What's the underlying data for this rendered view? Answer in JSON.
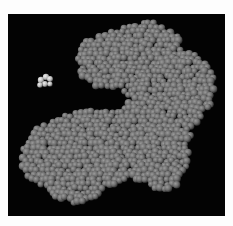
{
  "image": {
    "description": "Space-filling molecular model of a protein with a small bound ligand on black background",
    "background": "#030303",
    "border": "#fdfdfd",
    "sphere_color": "#6b6b6b",
    "sphere_highlight": "#9a9a9a",
    "sphere_shadow": "#2a2a2a",
    "ligand_color": "#d8d8d8",
    "protein_outline": [
      [
        80,
        44
      ],
      [
        100,
        36
      ],
      [
        135,
        24
      ],
      [
        150,
        20
      ],
      [
        160,
        24
      ],
      [
        175,
        34
      ],
      [
        183,
        42
      ],
      [
        180,
        52
      ],
      [
        200,
        56
      ],
      [
        212,
        66
      ],
      [
        214,
        86
      ],
      [
        212,
        104
      ],
      [
        200,
        118
      ],
      [
        192,
        130
      ],
      [
        190,
        150
      ],
      [
        186,
        170
      ],
      [
        175,
        188
      ],
      [
        160,
        190
      ],
      [
        145,
        184
      ],
      [
        130,
        180
      ],
      [
        110,
        186
      ],
      [
        95,
        200
      ],
      [
        78,
        206
      ],
      [
        58,
        200
      ],
      [
        50,
        190
      ],
      [
        30,
        180
      ],
      [
        20,
        166
      ],
      [
        24,
        146
      ],
      [
        35,
        130
      ],
      [
        56,
        118
      ],
      [
        80,
        110
      ],
      [
        100,
        112
      ],
      [
        118,
        112
      ],
      [
        126,
        104
      ],
      [
        112,
        96
      ],
      [
        94,
        88
      ],
      [
        80,
        76
      ],
      [
        78,
        60
      ]
    ],
    "gap_cutout": [
      [
        92,
        88
      ],
      [
        120,
        88
      ],
      [
        130,
        100
      ],
      [
        118,
        110
      ],
      [
        98,
        108
      ],
      [
        86,
        100
      ]
    ],
    "ligand_spheres": [
      [
        41,
        80,
        3.2
      ],
      [
        46,
        77,
        3.2
      ],
      [
        50,
        79,
        3
      ],
      [
        45,
        84,
        3
      ],
      [
        40,
        85,
        2.8
      ],
      [
        50,
        84,
        2.6
      ]
    ],
    "sphere_radius": 3.6,
    "sphere_spacing": 5.2,
    "seed": 7
  }
}
